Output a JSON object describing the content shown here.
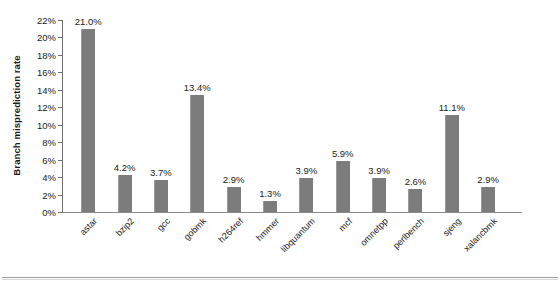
{
  "chart_data": {
    "type": "bar",
    "title": "",
    "subtitle": "",
    "xlabel": "",
    "ylabel": "Branch misprediction rate",
    "categories": [
      "astar",
      "bzip2",
      "gcc",
      "gobmk",
      "h264ref",
      "hmmer",
      "libquantum",
      "mcf",
      "omnetpp",
      "perlbench",
      "sjeng",
      "xalancbmk"
    ],
    "values": [
      21.0,
      4.2,
      3.7,
      13.4,
      2.9,
      1.3,
      3.9,
      5.9,
      3.9,
      2.6,
      11.1,
      2.9
    ],
    "value_labels": [
      "21.0%",
      "4.2%",
      "3.7%",
      "13.4%",
      "2.9%",
      "1.3%",
      "3.9%",
      "5.9%",
      "3.9%",
      "2.6%",
      "11.1%",
      "2.9%"
    ],
    "ylim": [
      0,
      22
    ],
    "ytick_values": [
      0,
      2,
      4,
      6,
      8,
      10,
      12,
      14,
      16,
      18,
      20,
      22
    ],
    "ytick_labels": [
      "0%",
      "2%",
      "4%",
      "6%",
      "8%",
      "10%",
      "12%",
      "14%",
      "16%",
      "18%",
      "20%",
      "22%"
    ],
    "grid": false,
    "legend": false,
    "legend_position": "none",
    "bar_color": "#7c7c7c",
    "axis_color": "#6e6e6e",
    "text_color": "#1a1a1a"
  },
  "footer": {
    "caption_sliver": ""
  }
}
